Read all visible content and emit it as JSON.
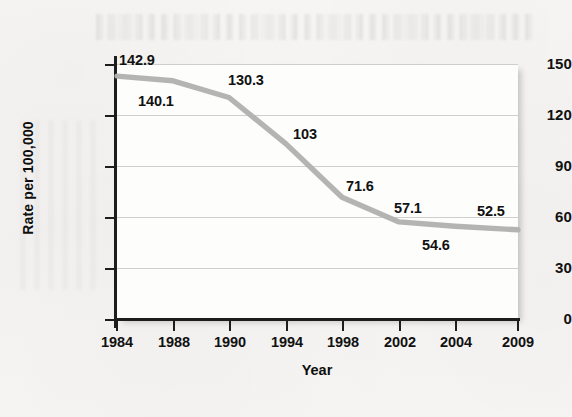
{
  "chart_data": {
    "type": "line",
    "title": "",
    "subtitle": "",
    "xlabel": "Year",
    "ylabel": "Rate per 100,000",
    "categories": [
      "1984",
      "1988",
      "1990",
      "1994",
      "1998",
      "2002",
      "2004",
      "2009"
    ],
    "values": [
      142.9,
      140.1,
      130.3,
      103,
      71.6,
      57.1,
      54.6,
      52.5
    ],
    "point_labels": [
      "142.9",
      "140.1",
      "130.3",
      "103",
      "71.6",
      "57.1",
      "54.6",
      "52.5"
    ],
    "series": [
      {
        "name": "Rate per 100,000",
        "values": [
          142.9,
          140.1,
          130.3,
          103,
          71.6,
          57.1,
          54.6,
          52.5
        ]
      }
    ],
    "xtick_labels": [
      "1984",
      "1988",
      "1990",
      "1994",
      "1998",
      "2002",
      "2004",
      "2009"
    ],
    "ytick_labels": [
      "0",
      "30",
      "60",
      "90",
      "120",
      "150"
    ],
    "ytick_values": [
      0,
      30,
      60,
      90,
      120,
      150
    ],
    "ylim": [
      0,
      150
    ],
    "grid": "horizontal",
    "legend": "none",
    "line_color": "#b2b2b0",
    "axis_color": "#1d1d1d",
    "gridline_color": "#cfcfcd",
    "plot_background": "#fdfdfc",
    "page_background": "#f5f4f2",
    "x_axis_scale": "categorical-evenly-spaced",
    "annotations": [
      {
        "label": "142.9",
        "category": "1984",
        "value": 142.9,
        "position": "above-right"
      },
      {
        "label": "140.1",
        "category": "1988",
        "value": 140.1,
        "position": "below"
      },
      {
        "label": "130.3",
        "category": "1990",
        "value": 130.3,
        "position": "above-right"
      },
      {
        "label": "103",
        "category": "1994",
        "value": 103,
        "position": "above-right"
      },
      {
        "label": "71.6",
        "category": "1998",
        "value": 71.6,
        "position": "above-right"
      },
      {
        "label": "57.1",
        "category": "2002",
        "value": 57.1,
        "position": "above"
      },
      {
        "label": "54.6",
        "category": "2004",
        "value": 54.6,
        "position": "below"
      },
      {
        "label": "52.5",
        "category": "2009",
        "value": 52.5,
        "position": "above-left"
      }
    ]
  },
  "ytick_labels": {
    "t150": "150",
    "t120": "120",
    "t90": "90",
    "t60": "60",
    "t30": "30",
    "t0": "0"
  },
  "xtick_labels": {
    "x0": "1984",
    "x1": "1988",
    "x2": "1990",
    "x3": "1994",
    "x4": "1998",
    "x5": "2002",
    "x6": "2004",
    "x7": "2009"
  },
  "point_labels": {
    "p0": "142.9",
    "p1": "140.1",
    "p2": "130.3",
    "p3": "103",
    "p4": "71.6",
    "p5": "57.1",
    "p6": "54.6",
    "p7": "52.5"
  },
  "axis_titles": {
    "x": "Year",
    "y": "Rate per 100,000"
  }
}
